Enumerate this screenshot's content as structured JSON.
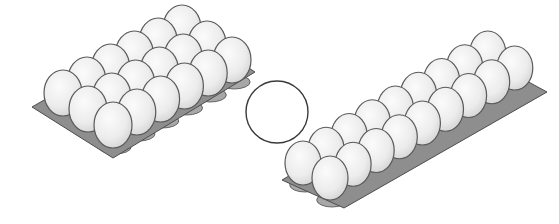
{
  "scene": {
    "description": "Two egg cartons with a blank circle between them",
    "background": "#ffffff"
  },
  "colors": {
    "egg_fill": "#f1f1f1",
    "egg_shade": "#d6d6d6",
    "egg_stroke": "#5a5a5a",
    "tray_fill": "#8e8e8e",
    "tray_cup": "#a7a7a7",
    "tray_stroke": "#4d4d4d",
    "circle_stroke": "#3a3a3a"
  },
  "cartons": [
    {
      "id": "left-carton",
      "rows": 3,
      "columns": 6,
      "egg_count": 18,
      "origin": [
        63,
        93
      ],
      "col_step": [
        23.8,
        -13
      ],
      "row_step": [
        25,
        16
      ],
      "egg_rx": 19,
      "egg_ry": 23,
      "tray": [
        [
          32,
          107
        ],
        [
          178,
          23
        ],
        [
          255,
          72
        ],
        [
          113,
          158
        ]
      ]
    },
    {
      "id": "right-carton",
      "rows": 2,
      "columns": 9,
      "egg_count": 18,
      "origin": [
        303,
        163
      ],
      "col_step": [
        23.1,
        -13.75
      ],
      "row_step": [
        27,
        15
      ],
      "egg_rx": 18,
      "egg_ry": 22,
      "tray": [
        [
          282,
          180
        ],
        [
          488,
          60
        ],
        [
          547,
          92
        ],
        [
          344,
          208
        ]
      ]
    }
  ],
  "circle": {
    "cx": 277,
    "cy": 112,
    "r": 31,
    "label": ""
  }
}
